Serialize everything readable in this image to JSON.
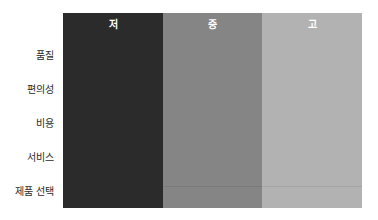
{
  "columns": [
    {
      "label": "저",
      "color": "#2b2b2b"
    },
    {
      "label": "중",
      "color": "#858585"
    },
    {
      "label": "고",
      "color": "#b2b2b2"
    }
  ],
  "rows": [
    {
      "label": "품질"
    },
    {
      "label": "편의성"
    },
    {
      "label": "비용"
    },
    {
      "label": "서비스"
    },
    {
      "label": "제품 선택"
    }
  ]
}
